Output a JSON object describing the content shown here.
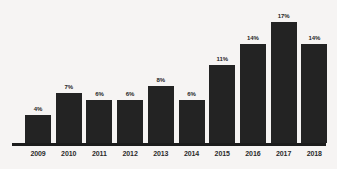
{
  "chart_data": {
    "type": "bar",
    "title": "",
    "subtitle": "",
    "xlabel": "",
    "ylabel": "",
    "categories": [
      "2009",
      "2010",
      "2011",
      "2012",
      "2013",
      "2014",
      "2015",
      "2016",
      "2017",
      "2018"
    ],
    "values": [
      4,
      7,
      6,
      6,
      8,
      6,
      11,
      14,
      17,
      14
    ],
    "value_labels": [
      "4%",
      "7%",
      "6%",
      "6%",
      "8%",
      "6%",
      "11%",
      "14%",
      "17%",
      "14%"
    ],
    "value_unit": "%",
    "ylim": [
      0,
      19
    ],
    "grid": false,
    "legend": false,
    "legend_position": "none",
    "axis": {
      "x_axis_visible": true,
      "y_axis_visible": false,
      "tick_marks": false
    },
    "colors": {
      "bar": "#232323",
      "background": "#f6f4f3",
      "axis_line": "#1c1c1c",
      "label_text": "#262626",
      "tick_text": "#2a2a2a"
    }
  }
}
